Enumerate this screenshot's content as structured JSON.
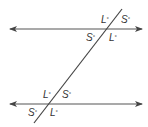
{
  "figure": {
    "lines": {
      "top_parallel": {
        "y": 29,
        "x1": 10,
        "x2": 142
      },
      "bottom_parallel": {
        "y": 104,
        "x1": 10,
        "x2": 142
      },
      "transversal": {
        "x1": 122,
        "y1": 9,
        "x2": 34,
        "y2": 123
      }
    },
    "line_color": "#444444",
    "angles": {
      "top": [
        {
          "id": "top-upper-left",
          "label": "L",
          "deg": "°"
        },
        {
          "id": "top-upper-right",
          "label": "S",
          "deg": "°"
        },
        {
          "id": "top-lower-left",
          "label": "S",
          "deg": "°"
        },
        {
          "id": "top-lower-right",
          "label": "L",
          "deg": "°"
        }
      ],
      "bottom": [
        {
          "id": "bottom-upper-left",
          "label": "L",
          "deg": "°"
        },
        {
          "id": "bottom-upper-right",
          "label": "S",
          "deg": "°"
        },
        {
          "id": "bottom-lower-left",
          "label": "S",
          "deg": "°"
        },
        {
          "id": "bottom-lower-right",
          "label": "L",
          "deg": "°"
        }
      ]
    }
  }
}
